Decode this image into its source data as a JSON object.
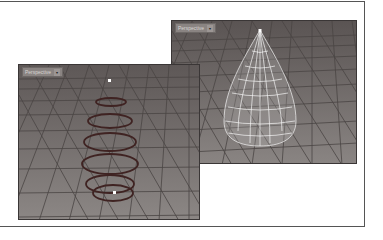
{
  "figure": {
    "viewports": [
      {
        "id": "right",
        "label": "Perspective",
        "dropdown_icon": "chevron-down-icon",
        "content": "wireframe teardrop surface"
      },
      {
        "id": "left",
        "label": "Perspective",
        "dropdown_icon": "chevron-down-icon",
        "content": "stacked circle curves"
      }
    ]
  },
  "colors": {
    "viewport_bg": "#6f6968",
    "grid": "#4e4948",
    "curves": "#4a2b2a",
    "wireframe": "#f2f2f2"
  }
}
